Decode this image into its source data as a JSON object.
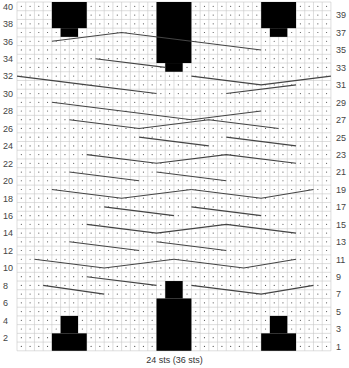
{
  "chart": {
    "stitches": 36,
    "rows": 40,
    "caption": "24 sts (36 sts)",
    "grid": {
      "x0": 17,
      "y0": 2,
      "cell": 8.72
    },
    "colors": {
      "grid": "#c8c8c8",
      "dot": "#555555",
      "block": "#000000",
      "line": "#444444",
      "label": "#444444"
    },
    "left_labels_even": [
      40,
      38,
      36,
      34,
      32,
      30,
      28,
      26,
      24,
      22,
      20,
      18,
      16,
      14,
      12,
      10,
      8,
      6,
      4,
      2
    ],
    "right_labels_odd": [
      39,
      37,
      35,
      33,
      31,
      29,
      27,
      25,
      23,
      21,
      19,
      17,
      15,
      13,
      11,
      9,
      7,
      5,
      3,
      1
    ],
    "blocks": [
      {
        "c0": 4,
        "c1": 7,
        "r0": 38,
        "r1": 40
      },
      {
        "c0": 5,
        "c1": 6,
        "r0": 37,
        "r1": 37
      },
      {
        "c0": 28,
        "c1": 31,
        "r0": 38,
        "r1": 40
      },
      {
        "c0": 29,
        "c1": 30,
        "r0": 37,
        "r1": 37
      },
      {
        "c0": 16,
        "c1": 19,
        "r0": 34,
        "r1": 40
      },
      {
        "c0": 17,
        "c1": 18,
        "r0": 33,
        "r1": 33
      },
      {
        "c0": 4,
        "c1": 7,
        "r0": 1,
        "r1": 2
      },
      {
        "c0": 5,
        "c1": 6,
        "r0": 3,
        "r1": 4
      },
      {
        "c0": 28,
        "c1": 31,
        "r0": 1,
        "r1": 2
      },
      {
        "c0": 29,
        "c1": 30,
        "r0": 3,
        "r1": 4
      },
      {
        "c0": 16,
        "c1": 19,
        "r0": 1,
        "r1": 6
      },
      {
        "c0": 17,
        "c1": 18,
        "r0": 7,
        "r1": 8
      }
    ],
    "cable_lines": [
      [
        [
          4,
          35.5
        ],
        [
          12,
          36.5
        ],
        [
          20,
          35.5
        ]
      ],
      [
        [
          20,
          35.5
        ],
        [
          28,
          34.5
        ]
      ],
      [
        [
          9,
          33.5
        ],
        [
          17,
          32.5
        ]
      ],
      [
        [
          20,
          31.5
        ],
        [
          28,
          30.5
        ],
        [
          36,
          31.5
        ]
      ],
      [
        [
          0,
          31.5
        ],
        [
          8,
          30.5
        ]
      ],
      [
        [
          8,
          30.5
        ],
        [
          16,
          29.5
        ]
      ],
      [
        [
          24,
          29.5
        ],
        [
          32,
          30.5
        ]
      ],
      [
        [
          4,
          28.5
        ],
        [
          12,
          27.5
        ]
      ],
      [
        [
          12,
          27.5
        ],
        [
          20,
          26.5
        ],
        [
          28,
          27.5
        ]
      ],
      [
        [
          6,
          26.5
        ],
        [
          14,
          25.5
        ],
        [
          22,
          26.5
        ],
        [
          30,
          25.5
        ]
      ],
      [
        [
          14,
          24.5
        ],
        [
          22,
          23.5
        ]
      ],
      [
        [
          24,
          24.5
        ],
        [
          32,
          23.5
        ]
      ],
      [
        [
          8,
          22.5
        ],
        [
          16,
          21.5
        ],
        [
          24,
          22.5
        ],
        [
          32,
          21.5
        ]
      ],
      [
        [
          6,
          20.5
        ],
        [
          14,
          19.5
        ]
      ],
      [
        [
          16,
          20.5
        ],
        [
          24,
          19.5
        ]
      ],
      [
        [
          4,
          18.5
        ],
        [
          12,
          17.5
        ],
        [
          20,
          18.5
        ]
      ],
      [
        [
          20,
          18.5
        ],
        [
          28,
          17.5
        ],
        [
          34,
          18.5
        ]
      ],
      [
        [
          10,
          16.5
        ],
        [
          18,
          15.5
        ]
      ],
      [
        [
          20,
          16.5
        ],
        [
          28,
          15.5
        ]
      ],
      [
        [
          8,
          14.5
        ],
        [
          16,
          13.5
        ],
        [
          24,
          14.5
        ],
        [
          32,
          13.5
        ]
      ],
      [
        [
          6,
          12.5
        ],
        [
          14,
          11.5
        ]
      ],
      [
        [
          16,
          12.5
        ],
        [
          24,
          11.5
        ]
      ],
      [
        [
          2,
          10.5
        ],
        [
          10,
          9.5
        ],
        [
          18,
          10.5
        ]
      ],
      [
        [
          18,
          10.5
        ],
        [
          26,
          9.5
        ],
        [
          32,
          10.5
        ]
      ],
      [
        [
          8,
          8.5
        ],
        [
          16,
          7.5
        ]
      ],
      [
        [
          20,
          7.5
        ],
        [
          28,
          6.5
        ],
        [
          34,
          7.5
        ]
      ],
      [
        [
          3,
          7.5
        ],
        [
          10,
          6.5
        ]
      ]
    ]
  }
}
